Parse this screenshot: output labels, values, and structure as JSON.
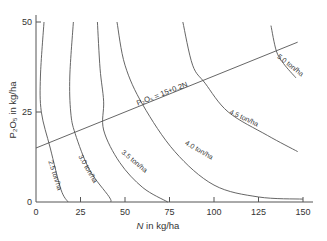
{
  "chart_data": {
    "type": "line",
    "title": "",
    "xlabel": "N in kg/ha",
    "ylabel": "P2O5 in kg/ha",
    "xlim": [
      0,
      155
    ],
    "ylim": [
      0,
      52
    ],
    "x_ticks": [
      0,
      25,
      50,
      75,
      100,
      125,
      150
    ],
    "y_ticks": [
      0,
      25,
      50
    ],
    "grid": false,
    "legend": "none (inline curve labels)",
    "series": [
      {
        "name": "2.5 ton/ha",
        "points": [
          [
            4.5,
            50
          ],
          [
            2.5,
            35
          ],
          [
            3,
            25
          ],
          [
            8,
            15
          ],
          [
            14,
            3.5
          ],
          [
            18,
            0
          ]
        ]
      },
      {
        "name": "3.0 ton/ha",
        "points": [
          [
            21,
            50
          ],
          [
            19,
            35
          ],
          [
            19.5,
            25
          ],
          [
            22,
            19
          ],
          [
            30,
            9
          ],
          [
            41,
            1.5
          ],
          [
            42,
            0
          ]
        ]
      },
      {
        "name": "3.5 ton/ha",
        "points": [
          [
            34.5,
            50
          ],
          [
            36,
            37
          ],
          [
            38,
            28
          ],
          [
            38,
            20
          ],
          [
            47,
            11
          ],
          [
            60,
            4
          ],
          [
            74,
            0
          ]
        ]
      },
      {
        "name": "4.0 ton/ha",
        "points": [
          [
            45.5,
            50
          ],
          [
            50,
            38
          ],
          [
            60,
            27
          ],
          [
            78,
            14
          ],
          [
            100,
            4.7
          ],
          [
            125,
            1.4
          ],
          [
            150,
            0.8
          ]
        ]
      },
      {
        "name": "4.5 ton/ha",
        "points": [
          [
            82.5,
            50
          ],
          [
            88,
            38
          ],
          [
            95,
            33
          ],
          [
            108,
            25
          ],
          [
            130,
            18.5
          ],
          [
            147,
            14
          ]
        ]
      },
      {
        "name": "5.0 ton/ha",
        "points": [
          [
            132,
            49
          ],
          [
            135,
            42
          ],
          [
            139,
            38.5
          ],
          [
            146,
            34.5
          ]
        ]
      },
      {
        "name": "P2O5 = 15+0.2N",
        "points": [
          [
            0,
            15
          ],
          [
            147,
            44.4
          ]
        ]
      }
    ],
    "annotations": [
      "P2O5 = 15+0.2N",
      "2.5 ton/ha",
      "3.0 ton/ha",
      "3.5 ton/ha",
      "4.0 ton/ha",
      "4.5 ton/ha",
      "5.0 ton/ha"
    ]
  },
  "labels": {
    "xlabel_italic": "N",
    "xlabel_rest": " in kg/ha",
    "ylabel": "P₂O₅ in kg/ha",
    "line_label": "P₂O₅ = 15+0.2N",
    "curve_labels": [
      "2.5 ton/ha",
      "3.0 ton/ha",
      "3.5 ton/ha",
      "4.0 ton/ha",
      "4.5 ton/ha",
      "5.0 ton/ha"
    ],
    "x_tick_labels": [
      "0",
      "25",
      "50",
      "75",
      "100",
      "125",
      "150"
    ],
    "y_tick_labels": [
      "0",
      "25",
      "50"
    ]
  },
  "colors": {
    "line": "#555555",
    "text": "#333333"
  }
}
